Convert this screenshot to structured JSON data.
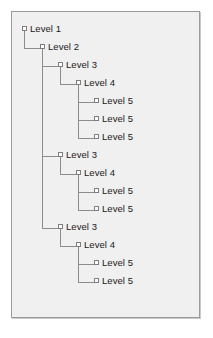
{
  "diagram": {
    "background_color": "#f0f0f0",
    "frame_border_color": "#9a9a9a",
    "line_color": "#8c8c8c",
    "node_fill_color": "#ffffff",
    "node_border_color": "#7e7e7e",
    "text_color": "#1a1a1a",
    "nodes": [
      {
        "id": "n1",
        "label": "Level 1",
        "depth": 1,
        "x": 10,
        "y": 15
      },
      {
        "id": "n2",
        "label": "Level 2",
        "depth": 2,
        "x": 28,
        "y": 33
      },
      {
        "id": "n3",
        "label": "Level 3",
        "depth": 3,
        "x": 46,
        "y": 51
      },
      {
        "id": "n4",
        "label": "Level 4",
        "depth": 4,
        "x": 64,
        "y": 69
      },
      {
        "id": "n5",
        "label": "Level 5",
        "depth": 5,
        "x": 82,
        "y": 87
      },
      {
        "id": "n6",
        "label": "Level 5",
        "depth": 5,
        "x": 82,
        "y": 105
      },
      {
        "id": "n7",
        "label": "Level 5",
        "depth": 5,
        "x": 82,
        "y": 123
      },
      {
        "id": "n8",
        "label": "Level 3",
        "depth": 3,
        "x": 46,
        "y": 141
      },
      {
        "id": "n9",
        "label": "Level 4",
        "depth": 4,
        "x": 64,
        "y": 159
      },
      {
        "id": "n10",
        "label": "Level 5",
        "depth": 5,
        "x": 82,
        "y": 177
      },
      {
        "id": "n11",
        "label": "Level 5",
        "depth": 5,
        "x": 82,
        "y": 195
      },
      {
        "id": "n12",
        "label": "Level 3",
        "depth": 3,
        "x": 46,
        "y": 213
      },
      {
        "id": "n13",
        "label": "Level 4",
        "depth": 4,
        "x": 64,
        "y": 231
      },
      {
        "id": "n14",
        "label": "Level 5",
        "depth": 5,
        "x": 82,
        "y": 249
      },
      {
        "id": "n15",
        "label": "Level 5",
        "depth": 5,
        "x": 82,
        "y": 267
      }
    ],
    "connectors": [
      {
        "from": "n1",
        "to": "n2",
        "trunk_x": 12,
        "start_y": 18,
        "end_y": 36,
        "end_x": 28
      },
      {
        "from": "n2",
        "to": "n3",
        "trunk_x": 30,
        "start_y": 36,
        "end_y": 54,
        "end_x": 46
      },
      {
        "from": "n2",
        "to": "n8",
        "trunk_x": 30,
        "start_y": 36,
        "end_y": 144,
        "end_x": 46
      },
      {
        "from": "n2",
        "to": "n12",
        "trunk_x": 30,
        "start_y": 36,
        "end_y": 216,
        "end_x": 46
      },
      {
        "from": "n3",
        "to": "n4",
        "trunk_x": 48,
        "start_y": 54,
        "end_y": 72,
        "end_x": 64
      },
      {
        "from": "n4",
        "to": "n5",
        "trunk_x": 66,
        "start_y": 72,
        "end_y": 90,
        "end_x": 82
      },
      {
        "from": "n4",
        "to": "n6",
        "trunk_x": 66,
        "start_y": 72,
        "end_y": 108,
        "end_x": 82
      },
      {
        "from": "n4",
        "to": "n7",
        "trunk_x": 66,
        "start_y": 72,
        "end_y": 126,
        "end_x": 82
      },
      {
        "from": "n8",
        "to": "n9",
        "trunk_x": 48,
        "start_y": 144,
        "end_y": 162,
        "end_x": 64
      },
      {
        "from": "n9",
        "to": "n10",
        "trunk_x": 66,
        "start_y": 162,
        "end_y": 180,
        "end_x": 82
      },
      {
        "from": "n9",
        "to": "n11",
        "trunk_x": 66,
        "start_y": 162,
        "end_y": 198,
        "end_x": 82
      },
      {
        "from": "n12",
        "to": "n13",
        "trunk_x": 48,
        "start_y": 216,
        "end_y": 234,
        "end_x": 64
      },
      {
        "from": "n13",
        "to": "n14",
        "trunk_x": 66,
        "start_y": 234,
        "end_y": 252,
        "end_x": 82
      },
      {
        "from": "n13",
        "to": "n15",
        "trunk_x": 66,
        "start_y": 234,
        "end_y": 270,
        "end_x": 82
      }
    ]
  }
}
